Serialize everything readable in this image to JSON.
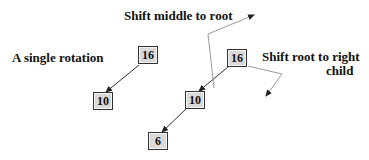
{
  "diagram": {
    "title": "A single rotation",
    "annotations": {
      "shift_middle": "Shift middle to root",
      "shift_root_line1": "Shift root to right",
      "shift_root_line2": "child"
    },
    "before_tree": {
      "nodes": [
        {
          "id": "b16",
          "value": "16",
          "role": "root"
        },
        {
          "id": "b10",
          "value": "10",
          "role": "left-child"
        }
      ],
      "edges": [
        [
          "b16",
          "b10"
        ]
      ]
    },
    "after_tree": {
      "nodes": [
        {
          "id": "a16",
          "value": "16",
          "role": "root"
        },
        {
          "id": "a10",
          "value": "10",
          "role": "left-child"
        },
        {
          "id": "a6",
          "value": "6",
          "role": "left-grandchild"
        }
      ],
      "edges": [
        [
          "a16",
          "a10"
        ],
        [
          "a10",
          "a6"
        ]
      ]
    },
    "colors": {
      "node_fill": "#d9d9d9",
      "node_border": "#333333",
      "edge": "#333333",
      "guide_line": "#9a9a9a",
      "text": "#111111"
    }
  }
}
